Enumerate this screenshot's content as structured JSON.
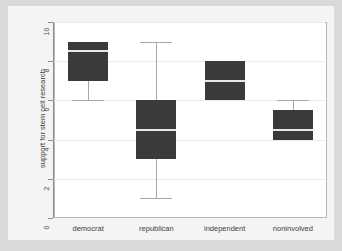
{
  "chart_data": {
    "type": "box",
    "title": "",
    "xlabel": "",
    "ylabel": "support for stem cell research",
    "categories": [
      "democrat",
      "republican",
      "independent",
      "noninvolved"
    ],
    "ylim": [
      0,
      10
    ],
    "yticks": [
      0,
      2,
      4,
      6,
      8,
      10
    ],
    "ytick_labels": [
      "0",
      "2",
      "4",
      "6",
      "8",
      "10"
    ],
    "grid": true,
    "legend": "none",
    "boxes": [
      {
        "category": "democrat",
        "whisker_low": 6,
        "q1": 7,
        "median": 8.5,
        "q3": 9,
        "whisker_high": 9
      },
      {
        "category": "republican",
        "whisker_low": 1,
        "q1": 3,
        "median": 4.5,
        "q3": 6,
        "whisker_high": 9
      },
      {
        "category": "independent",
        "whisker_low": 6,
        "q1": 6,
        "median": 7,
        "q3": 8,
        "whisker_high": 8
      },
      {
        "category": "noninvolved",
        "whisker_low": 4,
        "q1": 4,
        "median": 4.5,
        "q3": 5.5,
        "whisker_high": 6
      }
    ],
    "colors": {
      "box_fill": "#3a3a3a",
      "median": "#e8e8e8",
      "whisker": "#a8a8a8",
      "grid": "#ececec",
      "axis": "#8c8c8c",
      "plot_background": "#ffffff",
      "figure_background": "#f4f4f4",
      "outer_background": "#d9d9d9"
    }
  }
}
